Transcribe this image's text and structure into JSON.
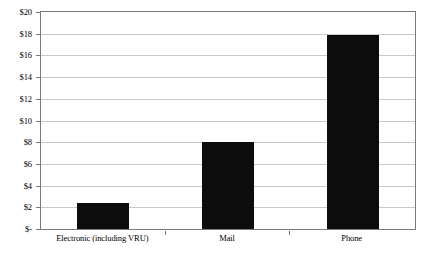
{
  "chart_data": {
    "type": "bar",
    "title": "",
    "xlabel": "",
    "ylabel": "",
    "categories": [
      "Electronic (including VRU)",
      "Mail",
      "Phone"
    ],
    "values": [
      2.4,
      8.0,
      17.9
    ],
    "ylim": [
      0,
      20
    ],
    "y_ticks": [
      0,
      2,
      4,
      6,
      8,
      10,
      12,
      14,
      16,
      18,
      20
    ],
    "y_tick_labels": [
      "$-",
      "$2",
      "$4",
      "$6",
      "$8",
      "$10",
      "$12",
      "$14",
      "$16",
      "$18",
      "$20"
    ],
    "grid": true,
    "legend": "none",
    "series": [
      {
        "name": "Cost",
        "color": "#0c0c0c",
        "values": [
          2.4,
          8.0,
          17.9
        ]
      }
    ]
  },
  "figure": {
    "bar_color": "#0c0c0c",
    "grid_color": "#c9c9c9",
    "frame_color": "#7a7a7a",
    "background": "#ffffff",
    "caption_partial": ""
  }
}
